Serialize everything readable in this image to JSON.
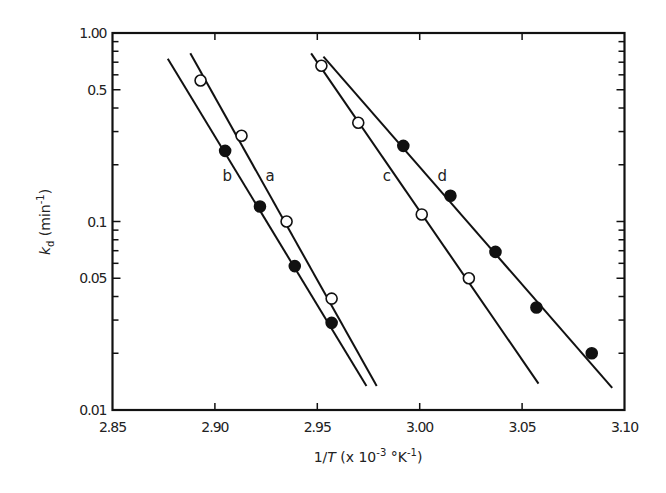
{
  "chart_data": {
    "type": "scatter",
    "title": "",
    "xlabel": "1/T (x 10^-3 °K^-1)",
    "ylabel": "k_d (min^-1)",
    "xlim": [
      2.85,
      3.1
    ],
    "ylim": [
      0.01,
      1.0
    ],
    "yscale": "log",
    "grid": false,
    "legend": "inline line labels (a, b, c, d)",
    "x_ticks": [
      2.85,
      2.9,
      2.95,
      3.0,
      3.05,
      3.1
    ],
    "x_tick_labels": [
      "2.85",
      "2.90",
      "2.95",
      "3.00",
      "3.05",
      "3.10"
    ],
    "y_ticks": [
      1.0,
      0.5,
      0.1,
      0.05,
      0.01
    ],
    "y_tick_labels": [
      "1.00",
      "0.5",
      "0.1",
      "0.05",
      "0.01"
    ],
    "series": [
      {
        "name": "a",
        "marker": "open-circle",
        "x": [
          2.893,
          2.913,
          2.935,
          2.957
        ],
        "y": [
          0.56,
          0.285,
          0.1,
          0.039
        ],
        "fit_line": {
          "x": [
            2.888,
            2.979
          ],
          "y": [
            0.78,
            0.0134
          ]
        },
        "label_pos": {
          "x": 2.927,
          "y": 0.175
        }
      },
      {
        "name": "b",
        "marker": "filled-circle",
        "x": [
          2.905,
          2.922,
          2.939,
          2.957
        ],
        "y": [
          0.237,
          0.12,
          0.058,
          0.029
        ],
        "fit_line": {
          "x": [
            2.877,
            2.974
          ],
          "y": [
            0.73,
            0.0134
          ]
        },
        "label_pos": {
          "x": 2.906,
          "y": 0.175
        }
      },
      {
        "name": "c",
        "marker": "open-circle",
        "x": [
          2.952,
          2.97,
          3.001,
          3.024
        ],
        "y": [
          0.67,
          0.334,
          0.109,
          0.05
        ],
        "fit_line": {
          "x": [
            2.947,
            3.058
          ],
          "y": [
            0.78,
            0.0138
          ]
        },
        "label_pos": {
          "x": 2.984,
          "y": 0.175
        }
      },
      {
        "name": "d",
        "marker": "filled-circle",
        "x": [
          2.992,
          3.015,
          3.037,
          3.057,
          3.084
        ],
        "y": [
          0.252,
          0.137,
          0.069,
          0.035,
          0.02
        ],
        "fit_line": {
          "x": [
            2.953,
            3.094
          ],
          "y": [
            0.75,
            0.0131
          ]
        },
        "label_pos": {
          "x": 3.011,
          "y": 0.175
        }
      }
    ]
  },
  "axes": {
    "x_title_main": "1/",
    "x_title_var": "T",
    "x_title_rest": " (x 10",
    "x_title_exp": "-3",
    "x_title_unit": " °K",
    "x_title_unit_exp": "-1",
    "x_title_close": ")",
    "y_title_var": "k",
    "y_title_sub": "d",
    "y_title_unit": " (min",
    "y_title_unit_exp": "-1",
    "y_title_close": ")"
  }
}
